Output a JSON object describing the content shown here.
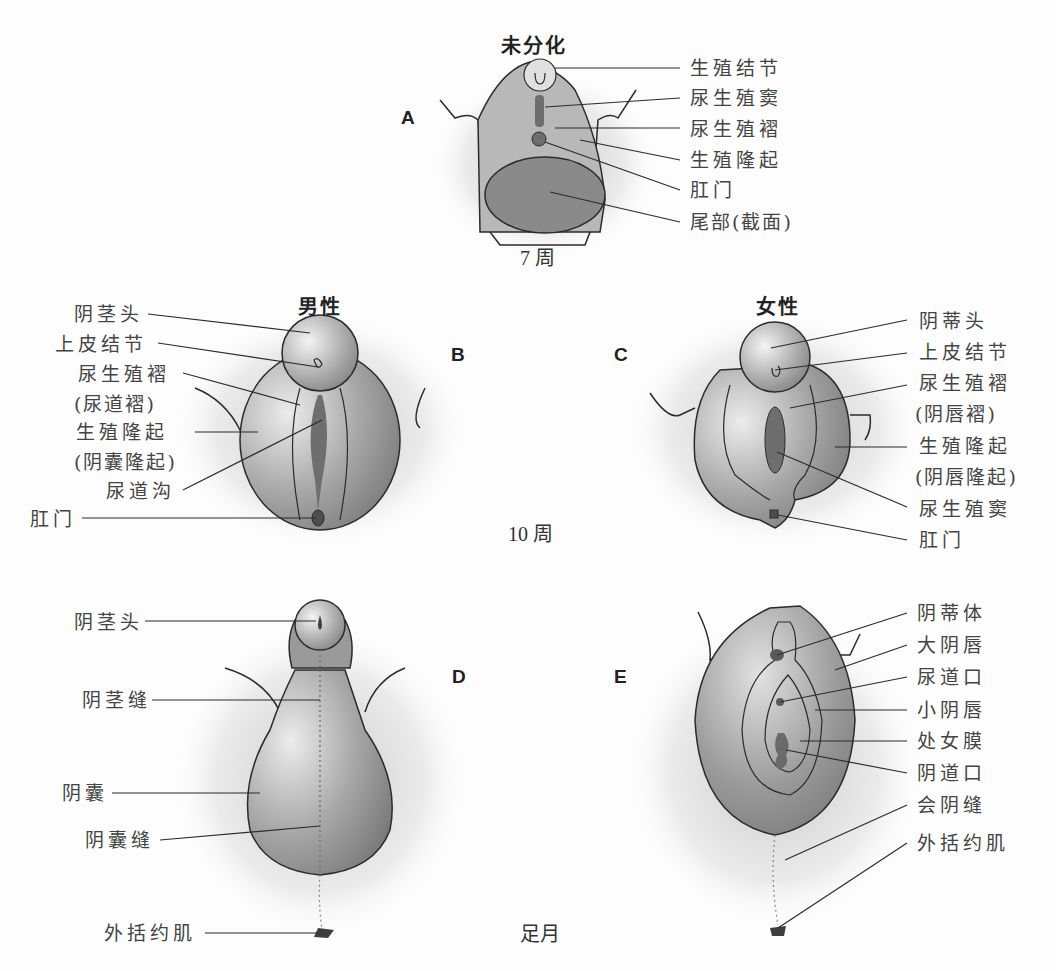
{
  "panels": {
    "A": {
      "letter": "A",
      "title": "未分化",
      "age": "7 周",
      "labels": [
        "生殖结节",
        "尿生殖窦",
        "尿生殖褶",
        "生殖隆起",
        "肛门",
        "尾部(截面)"
      ]
    },
    "B": {
      "letter": "B",
      "title": "男性",
      "labels": [
        "阴茎头",
        "上皮结节",
        "尿生殖褶",
        "(尿道褶)",
        "生殖隆起",
        "(阴囊隆起)",
        "尿道沟",
        "肛门"
      ]
    },
    "C": {
      "letter": "C",
      "title": "女性",
      "labels": [
        "阴蒂头",
        "上皮结节",
        "尿生殖褶",
        "(阴唇褶)",
        "生殖隆起",
        "(阴唇隆起)",
        "尿生殖窦",
        "肛门"
      ]
    },
    "middle_age": "10 周",
    "D": {
      "letter": "D",
      "labels": [
        "阴茎头",
        "阴茎缝",
        "阴囊",
        "阴囊缝",
        "外括约肌"
      ]
    },
    "E": {
      "letter": "E",
      "labels": [
        "阴蒂体",
        "大阴唇",
        "尿道口",
        "小阴唇",
        "处女膜",
        "阴道口",
        "会阴缝",
        "外括约肌"
      ]
    },
    "bottom_age": "足月"
  },
  "colors": {
    "tissue_light": "#e6e6e6",
    "tissue_mid": "#a9a9a9",
    "tissue_dark": "#7d7d7d",
    "opening": "#5a5a5a",
    "line": "#2b2b2b"
  }
}
